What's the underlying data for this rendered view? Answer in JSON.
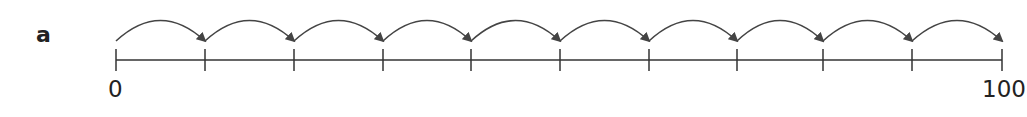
{
  "part_label": "a",
  "number_line": {
    "start_label": "0",
    "end_label": "100",
    "start_value": 0,
    "end_value": 100,
    "intervals": 10,
    "jump_size": 10,
    "tick_x": [
      116,
      205,
      294,
      383,
      471,
      560,
      649,
      737,
      823,
      912,
      1002
    ],
    "line_color": "#333333",
    "arrow_color": "#444444"
  }
}
